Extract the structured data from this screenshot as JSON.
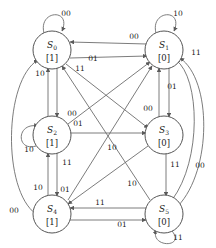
{
  "diagram": {
    "type": "finite-state-machine",
    "title": "",
    "notation": "S_i [output]",
    "states": [
      {
        "id": "S0",
        "name": "S",
        "subscript": "0",
        "output": "[1]",
        "cx": 52,
        "cy": 50
      },
      {
        "id": "S1",
        "name": "S",
        "subscript": "1",
        "output": "[0]",
        "cx": 164,
        "cy": 50
      },
      {
        "id": "S2",
        "name": "S",
        "subscript": "2",
        "output": "[1]",
        "cx": 52,
        "cy": 135
      },
      {
        "id": "S3",
        "name": "S",
        "subscript": "3",
        "output": "[0]",
        "cx": 164,
        "cy": 135
      },
      {
        "id": "S4",
        "name": "S",
        "subscript": "4",
        "output": "[1]",
        "cx": 52,
        "cy": 214
      },
      {
        "id": "S5",
        "name": "S",
        "subscript": "5",
        "output": "[0]",
        "cx": 164,
        "cy": 214
      }
    ],
    "self_loops": [
      {
        "state": "S0",
        "label": "00",
        "lx": 66,
        "ly": 16
      },
      {
        "state": "S1",
        "label": "10",
        "lx": 178,
        "ly": 16
      },
      {
        "state": "S2",
        "label": "10",
        "lx": 29,
        "ly": 152
      },
      {
        "state": "S5",
        "label": "11",
        "lx": 178,
        "ly": 240
      }
    ],
    "transitions": [
      {
        "from": "S1",
        "to": "S0",
        "label": "00",
        "lx": 134,
        "ly": 39
      },
      {
        "from": "S0",
        "to": "S1",
        "label": "01",
        "lx": 93,
        "ly": 61
      },
      {
        "from": "S1",
        "to": "S3",
        "label": "01",
        "lx": 172,
        "ly": 89
      },
      {
        "from": "S3",
        "to": "S1",
        "label": "00",
        "lx": 148,
        "ly": 111
      },
      {
        "from": "S5",
        "to": "S1",
        "label": "11",
        "lx": 196,
        "ly": 55
      },
      {
        "from": "S5",
        "to": "S1",
        "label": "00",
        "lx": 200,
        "ly": 168
      },
      {
        "from": "S0",
        "to": "S2",
        "label": "00",
        "lx": 72,
        "ly": 116
      },
      {
        "from": "S2",
        "to": "S0",
        "label": "10",
        "lx": 40,
        "ly": 76
      },
      {
        "from": "S0",
        "to": "S3",
        "label": "11",
        "lx": 80,
        "ly": 71
      },
      {
        "from": "S2",
        "to": "S3",
        "label": "01",
        "lx": 78,
        "ly": 126
      },
      {
        "from": "S3",
        "to": "S4",
        "label": "10",
        "lx": 112,
        "ly": 150
      },
      {
        "from": "S2",
        "to": "S4",
        "label": "11",
        "lx": 67,
        "ly": 165
      },
      {
        "from": "S4",
        "to": "S2",
        "label": "10",
        "lx": 38,
        "ly": 190
      },
      {
        "from": "S2",
        "to": "S4",
        "label": "01",
        "lx": 65,
        "ly": 192
      },
      {
        "from": "S3",
        "to": "S5",
        "label": "11",
        "lx": 175,
        "ly": 167
      },
      {
        "from": "S4",
        "to": "S1",
        "label": "10",
        "lx": 132,
        "ly": 186
      },
      {
        "from": "S5",
        "to": "S4",
        "label": "11",
        "lx": 100,
        "ly": 205
      },
      {
        "from": "S4",
        "to": "S5",
        "label": "01",
        "lx": 122,
        "ly": 227
      },
      {
        "from": "S4",
        "to": "S0",
        "label": "00",
        "lx": 14,
        "ly": 213
      }
    ]
  }
}
